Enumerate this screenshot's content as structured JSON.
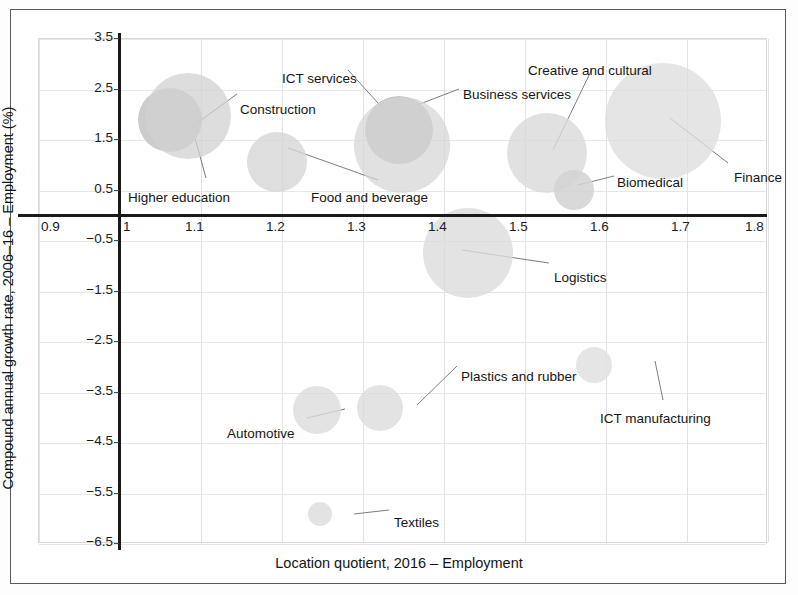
{
  "chart_data": {
    "type": "scatter",
    "title": "",
    "xlabel": "Location quotient, 2016 – Employment",
    "ylabel": "Compound annual growth rate, 2006–16 – Employment (%)",
    "xlim": [
      0.9,
      1.8
    ],
    "ylim": [
      -6.5,
      3.5
    ],
    "xticks": [
      "0.9",
      "1",
      "1.1",
      "1.2",
      "1.3",
      "1.4",
      "1.5",
      "1.6",
      "1.7",
      "1.8"
    ],
    "xtick_values": [
      0.9,
      1.0,
      1.1,
      1.2,
      1.3,
      1.4,
      1.5,
      1.6,
      1.7,
      1.8
    ],
    "yticks": [
      "3.5",
      "2.5",
      "1.5",
      "0.5",
      "−0.5",
      "−1.5",
      "−2.5",
      "−3.5",
      "−4.5",
      "−5.5",
      "−6.5"
    ],
    "ytick_values": [
      3.5,
      2.5,
      1.5,
      0.5,
      -0.5,
      -1.5,
      -2.5,
      -3.5,
      -4.5,
      -5.5,
      -6.5
    ],
    "grid": true,
    "legend": "none",
    "bubble_note": "Bubble area encodes sector employment size",
    "points": [
      {
        "label": "Higher education",
        "x": 1.063,
        "y": 1.88,
        "r_px": 32,
        "color": "#c3c3c3",
        "opacity": 0.85,
        "label_x": 128,
        "label_y": 190,
        "leader": [
          206,
          178,
          195,
          138
        ]
      },
      {
        "label": "Construction",
        "x": 1.085,
        "y": 1.95,
        "r_px": 43,
        "color": "#d2d2d2",
        "opacity": 0.75,
        "label_x": 240,
        "label_y": 102,
        "leader": [
          237,
          94,
          182,
          134
        ]
      },
      {
        "label": "ICT services",
        "x": 1.346,
        "y": 1.68,
        "r_px": 34,
        "color": "#bdbdbd",
        "opacity": 0.9,
        "label_x": 282,
        "label_y": 71,
        "leader": [
          348,
          70,
          398,
          125
        ]
      },
      {
        "label": "Business services",
        "x": 1.349,
        "y": 1.38,
        "r_px": 48,
        "color": "#d6d6d6",
        "opacity": 0.72,
        "label_x": 463,
        "label_y": 87,
        "leader": [
          459,
          89,
          412,
          107
        ]
      },
      {
        "label": "Food and beverage",
        "x": 1.195,
        "y": 1.05,
        "r_px": 30,
        "color": "#d6d6d6",
        "opacity": 0.8,
        "label_x": 311,
        "label_y": 190,
        "leader": [
          378,
          180,
          288,
          148
        ]
      },
      {
        "label": "Creative and cultural",
        "x": 1.528,
        "y": 1.22,
        "r_px": 40,
        "color": "#d9d9d9",
        "opacity": 0.8,
        "label_x": 528,
        "label_y": 63,
        "leader": [
          592,
          69,
          553,
          150
        ]
      },
      {
        "label": "Biomedical",
        "x": 1.562,
        "y": 0.49,
        "r_px": 20,
        "color": "#d2d2d2",
        "opacity": 0.85,
        "label_x": 617,
        "label_y": 175,
        "leader": [
          614,
          176,
          578,
          185
        ]
      },
      {
        "label": "Finance",
        "x": 1.672,
        "y": 1.85,
        "r_px": 58,
        "color": "#dedede",
        "opacity": 0.78,
        "label_x": 728,
        "label_y": 170,
        "leader": [
          728,
          163,
          670,
          118
        ]
      },
      {
        "label": "Logistics",
        "x": 1.431,
        "y": -0.76,
        "r_px": 45,
        "color": "#dcdcdc",
        "opacity": 0.8,
        "label_x": 554,
        "label_y": 270,
        "leader": [
          549,
          263,
          462,
          250
        ]
      },
      {
        "label": "Automotive",
        "x": 1.244,
        "y": -3.87,
        "r_px": 24,
        "color": "#dcdcdc",
        "opacity": 0.8,
        "label_x": 227,
        "label_y": 426,
        "leader": [
          307,
          418,
          345,
          409
        ]
      },
      {
        "label": "Plastics and rubber",
        "x": 1.322,
        "y": -3.83,
        "r_px": 23,
        "color": "#dcdcdc",
        "opacity": 0.8,
        "label_x": 461,
        "label_y": 369,
        "leader": [
          457,
          366,
          417,
          405
        ]
      },
      {
        "label": "ICT manufacturing",
        "x": 1.587,
        "y": -2.97,
        "r_px": 18,
        "color": "#e1e1e1",
        "opacity": 0.85,
        "label_x": 600,
        "label_y": 411,
        "leader": [
          663,
          400,
          655,
          361
        ]
      },
      {
        "label": "Textiles",
        "x": 1.248,
        "y": -5.93,
        "r_px": 12,
        "color": "#dcdcdc",
        "opacity": 0.8,
        "label_x": 394,
        "label_y": 515,
        "leader": [
          389,
          510,
          354,
          514
        ]
      }
    ]
  }
}
